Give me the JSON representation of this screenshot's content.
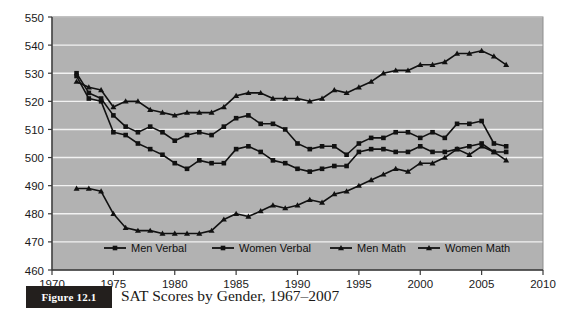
{
  "figure": {
    "tag_label": "Figure 12.1",
    "caption": "SAT Scores by Gender, 1967–2007"
  },
  "chart_data": {
    "type": "line",
    "title": "",
    "xlabel": "",
    "ylabel": "",
    "xlim": [
      1970,
      2010
    ],
    "ylim": [
      460,
      550
    ],
    "xticks": [
      1970,
      1975,
      1980,
      1985,
      1990,
      1995,
      2000,
      2005,
      2010
    ],
    "yticks": [
      460,
      470,
      480,
      490,
      500,
      510,
      520,
      530,
      540,
      550
    ],
    "grid": "horizontal",
    "legend_position": "bottom-inside",
    "plot_background": "#b2b2b2",
    "gridline_color": "#f2f2f2",
    "line_color": "#111111",
    "x": [
      1972,
      1973,
      1974,
      1975,
      1976,
      1977,
      1978,
      1979,
      1980,
      1981,
      1982,
      1983,
      1984,
      1985,
      1986,
      1987,
      1988,
      1989,
      1990,
      1991,
      1992,
      1993,
      1994,
      1995,
      1996,
      1997,
      1998,
      1999,
      2000,
      2001,
      2002,
      2003,
      2004,
      2005,
      2006,
      2007
    ],
    "series": [
      {
        "name": "Men Verbal",
        "marker": "square",
        "values": [
          530,
          523,
          521,
          515,
          511,
          509,
          511,
          509,
          506,
          508,
          509,
          508,
          511,
          514,
          515,
          512,
          512,
          510,
          505,
          503,
          504,
          504,
          501,
          505,
          507,
          507,
          509,
          509,
          507,
          509,
          507,
          512,
          512,
          513,
          505,
          504
        ]
      },
      {
        "name": "Women Verbal",
        "marker": "square",
        "values": [
          529,
          521,
          520,
          509,
          508,
          505,
          503,
          501,
          498,
          496,
          499,
          498,
          498,
          503,
          504,
          502,
          499,
          498,
          496,
          495,
          496,
          497,
          497,
          502,
          503,
          503,
          502,
          502,
          504,
          502,
          502,
          503,
          504,
          505,
          502,
          502
        ]
      },
      {
        "name": "Men Math",
        "marker": "triangle",
        "values": [
          527,
          525,
          524,
          518,
          520,
          520,
          517,
          516,
          515,
          516,
          516,
          516,
          518,
          522,
          523,
          523,
          521,
          521,
          521,
          520,
          521,
          524,
          523,
          525,
          527,
          530,
          531,
          531,
          533,
          533,
          534,
          537,
          537,
          538,
          536,
          533
        ]
      },
      {
        "name": "Women Math",
        "marker": "triangle",
        "values": [
          489,
          489,
          488,
          480,
          475,
          474,
          474,
          473,
          473,
          473,
          473,
          474,
          478,
          480,
          479,
          481,
          483,
          482,
          483,
          485,
          484,
          487,
          488,
          490,
          492,
          494,
          496,
          495,
          498,
          498,
          500,
          503,
          501,
          504,
          502,
          499
        ]
      }
    ]
  }
}
